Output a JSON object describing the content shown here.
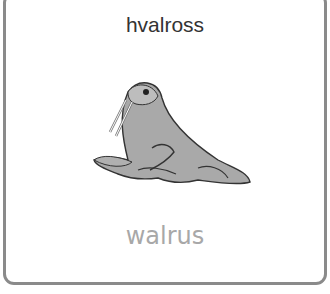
{
  "card": {
    "word": "hvalross",
    "translation": "walrus",
    "image": "walrus-illustration"
  },
  "colors": {
    "border": "#8a8a8a",
    "word": "#333333",
    "translation": "#a8a8a8"
  }
}
